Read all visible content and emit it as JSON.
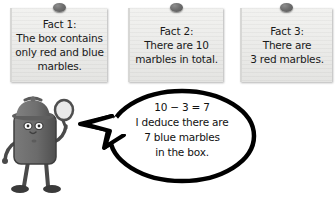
{
  "scene": {
    "title": "Deduction example with three fact notes and a detective",
    "background_color": "#ffffff"
  },
  "notes": [
    {
      "id": "fact-1",
      "pin_color": "#6e6e6e",
      "lines": [
        "Fact 1:",
        "The box contains",
        "only red and blue",
        "marbles."
      ]
    },
    {
      "id": "fact-2",
      "pin_color": "#6e6e6e",
      "lines": [
        "Fact 2:",
        "There are 10",
        "marbles in total."
      ]
    },
    {
      "id": "fact-3",
      "pin_color": "#6e6e6e",
      "lines": [
        "Fact 3:",
        "There are",
        "3 red marbles."
      ]
    }
  ],
  "speech_bubble": {
    "lines": [
      "10 − 3 = 7",
      "I deduce there are",
      "7 blue marbles",
      "in the box."
    ],
    "outline_color": "#000000",
    "fill_color": "#ffffff"
  },
  "character": {
    "name": "detective",
    "body_color": "#6b6b6b",
    "hat_color": "#707070",
    "accessory": "magnifying-glass"
  }
}
